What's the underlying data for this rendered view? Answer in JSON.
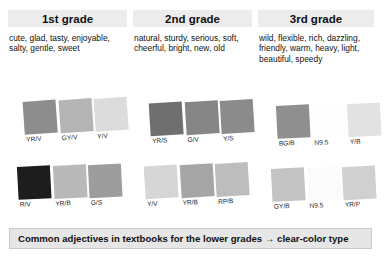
{
  "figure": {
    "footer_note": "Common adjectives in textbooks for the lower grades  →  clear-color type"
  },
  "columns": [
    {
      "heading": "1st grade",
      "adjective_lines": [
        "cute, glad, tasty, enjoyable,",
        "salty, gentle, sweet"
      ],
      "swatch_rows": [
        {
          "row": "top",
          "swatches": [
            {
              "label": "YR/V",
              "color": "#8d8d8d"
            },
            {
              "label": "GY/V",
              "color": "#b4b4b4"
            },
            {
              "label": "Y/V",
              "color": "#dcdcdc"
            }
          ]
        },
        {
          "row": "bottom",
          "swatches": [
            {
              "label": "R/V",
              "color": "#1d1d1d"
            },
            {
              "label": "YR/B",
              "color": "#b9b9b9"
            },
            {
              "label": "G/S",
              "color": "#9d9d9d"
            }
          ]
        }
      ]
    },
    {
      "heading": "2nd grade",
      "adjective_lines": [
        "natural, sturdy, serious, soft,",
        "cheerful, bright, new, old"
      ],
      "swatch_rows": [
        {
          "row": "top",
          "swatches": [
            {
              "label": "YR/S",
              "color": "#6f6f6f"
            },
            {
              "label": "G/V",
              "color": "#868686"
            },
            {
              "label": "Y/S",
              "color": "#8b8b8b"
            }
          ]
        },
        {
          "row": "bottom",
          "swatches": [
            {
              "label": "Y/V",
              "color": "#d6d6d6"
            },
            {
              "label": "YR/B",
              "color": "#a6a6a6"
            },
            {
              "label": "RP/B",
              "color": "#bdbdbd"
            }
          ]
        }
      ]
    },
    {
      "heading": "3rd grade",
      "adjective_lines": [
        "wild, flexible, rich, dazzling,",
        "friendly, warm, heavy, light,",
        "beautiful, speedy"
      ],
      "swatch_rows": [
        {
          "row": "top",
          "swatches": [
            {
              "label": "BG/B",
              "color": "#8f8f8f"
            },
            {
              "label": "N9.5",
              "color": "#fdfdfd"
            },
            {
              "label": "Y/B",
              "color": "#e2e2e2"
            }
          ]
        },
        {
          "row": "bottom",
          "swatches": [
            {
              "label": "GY/B",
              "color": "#c3c3c3"
            },
            {
              "label": "N9.5",
              "color": "#fbfbfb"
            },
            {
              "label": "YR/P",
              "color": "#d0d0d0"
            }
          ]
        }
      ]
    }
  ],
  "colors": {
    "heading_bg": "#ececec",
    "footer_bg": "#e6e6e6",
    "footer_border": "#c9c9c9",
    "text": "#111111"
  }
}
